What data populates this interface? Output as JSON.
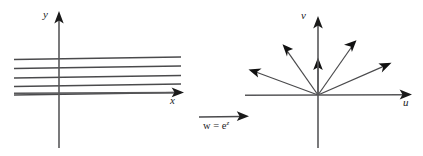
{
  "figure": {
    "width": 423,
    "height": 156,
    "background": "#ffffff",
    "stroke_color": "#4a4a4c",
    "axis_color": "#58585a",
    "arrow_fill": "#111111",
    "caption": "Mapping of horizontal lines in the z-plane onto rays in the w-plane under w = e^z"
  },
  "left_plane": {
    "name": "z-plane",
    "x_axis_label": "x",
    "y_axis_label": "y",
    "origin": {
      "x": 59,
      "y": 93
    },
    "x_axis": {
      "x1": 14,
      "y1": 93,
      "x2": 183,
      "y2": 93
    },
    "y_axis": {
      "x1": 59,
      "y1": 148,
      "x2": 59,
      "y2": 12
    },
    "line_count": 5,
    "lines": [
      {
        "x1": 14,
        "y1": 59.5,
        "x2": 181,
        "y2": 57.0
      },
      {
        "x1": 14,
        "y1": 68.5,
        "x2": 181,
        "y2": 66.0
      },
      {
        "x1": 14,
        "y1": 78.0,
        "x2": 181,
        "y2": 75.5
      },
      {
        "x1": 14,
        "y1": 86.5,
        "x2": 181,
        "y2": 84.0
      },
      {
        "x1": 14,
        "y1": 95.0,
        "x2": 181,
        "y2": 92.5
      }
    ],
    "x_label_pos": {
      "x": 172,
      "y": 99
    },
    "y_label_pos": {
      "x": 45,
      "y": 14
    }
  },
  "mapping": {
    "equation_text": "w = e",
    "equation_exponent": "z",
    "equation_plain": "w = e^z",
    "arrow": {
      "x1": 199,
      "y1": 117,
      "x2": 247,
      "y2": 117
    },
    "label_pos": {
      "x": 203,
      "y": 121
    }
  },
  "right_plane": {
    "name": "w-plane",
    "u_axis_label": "u",
    "v_axis_label": "v",
    "origin": {
      "x": 318,
      "y": 95
    },
    "u_axis": {
      "x1": 245,
      "y1": 95,
      "x2": 411,
      "y2": 95
    },
    "v_axis": {
      "x1": 318,
      "y1": 148,
      "x2": 318,
      "y2": 17
    },
    "ray_count": 5,
    "rays": [
      {
        "angle_deg": 160,
        "length": 72,
        "end": {
          "x": 251,
          "y": 70
        }
      },
      {
        "angle_deg": 125,
        "length": 62,
        "end": {
          "x": 283,
          "y": 45
        }
      },
      {
        "angle_deg": 90,
        "length": 37,
        "end": {
          "x": 318,
          "y": 58
        }
      },
      {
        "angle_deg": 55,
        "length": 66,
        "end": {
          "x": 356,
          "y": 41
        }
      },
      {
        "angle_deg": 20,
        "length": 78,
        "end": {
          "x": 391,
          "y": 62
        }
      }
    ],
    "u_label_pos": {
      "x": 404,
      "y": 101
    },
    "v_label_pos": {
      "x": 303,
      "y": 14
    }
  }
}
